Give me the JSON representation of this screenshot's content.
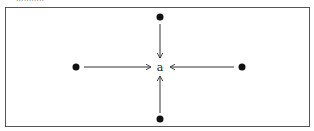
{
  "diagram": {
    "caption": "...........",
    "center_label": "a",
    "nodes": [
      {
        "id": "top",
        "direction": "down"
      },
      {
        "id": "left",
        "direction": "right"
      },
      {
        "id": "right",
        "direction": "left"
      },
      {
        "id": "bottom",
        "direction": "up"
      }
    ],
    "colors": {
      "dot": "#111111",
      "line": "#333333",
      "border": "#555555"
    }
  }
}
